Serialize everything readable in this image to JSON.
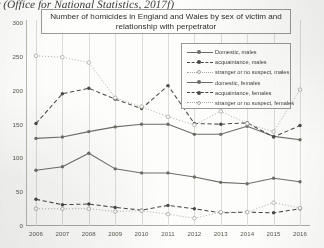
{
  "caption": "r (Office for National Statistics, 2017f)",
  "chart_title": "Number of homicides in England and Wales by sex of victim and relationship with perpetrator",
  "legend": {
    "items": [
      {
        "label": "Domestic, males",
        "style": "solid",
        "marker": "filled",
        "color": "#6e6e68"
      },
      {
        "label": "acquaintance, males",
        "style": "dashed",
        "marker": "filled",
        "color": "#4a4a45"
      },
      {
        "label": "stranger or no suspect, males",
        "style": "dotted",
        "marker": "open",
        "color": "#a6a6a0"
      },
      {
        "label": "domestic, females",
        "style": "solid",
        "marker": "filled",
        "color": "#6e6e68"
      },
      {
        "label": "acquaintance, females",
        "style": "dashed",
        "marker": "filled",
        "color": "#4a4a45"
      },
      {
        "label": "stranger or no suspect, females",
        "style": "dotted",
        "marker": "open",
        "color": "#a6a6a0"
      }
    ]
  },
  "chart_data": {
    "type": "line",
    "title": "Number of homicides in England and Wales by sex of victim and relationship with perpetrator",
    "xlabel": "",
    "ylabel": "",
    "grid": "vertical",
    "legend_position": "upper-right",
    "categories": [
      "2006",
      "2007",
      "2008",
      "2009",
      "2010",
      "2011",
      "2012",
      "2013",
      "2014",
      "2015",
      "2016"
    ],
    "x_tick_labels": [
      "2006",
      "2007",
      "2008",
      "2009",
      "2010",
      "2011",
      "2012",
      "2013",
      "2014",
      "2015",
      "2016"
    ],
    "y_tick_labels": [
      "0",
      "50",
      "100",
      "150",
      "200",
      "250",
      "300"
    ],
    "yticks": [
      0,
      50,
      100,
      150,
      200,
      250,
      300
    ],
    "ylim": [
      0,
      300
    ],
    "series": [
      {
        "name": "Domestic, males",
        "values": [
          128,
          130,
          138,
          145,
          149,
          149,
          134,
          134,
          146,
          131,
          126
        ]
      },
      {
        "name": "acquaintance, males",
        "values": [
          150,
          194,
          202,
          186,
          172,
          206,
          150,
          149,
          151,
          130,
          147
        ]
      },
      {
        "name": "stranger or no suspect, males",
        "values": [
          250,
          248,
          240,
          188,
          175,
          160,
          148,
          168,
          150,
          138,
          200
        ]
      },
      {
        "name": "domestic, females",
        "values": [
          81,
          86,
          106,
          83,
          77,
          77,
          71,
          63,
          61,
          69,
          64
        ]
      },
      {
        "name": "acquaintance, females",
        "values": [
          38,
          30,
          31,
          26,
          22,
          29,
          24,
          18,
          19,
          18,
          24
        ]
      },
      {
        "name": "stranger or no suspect, females",
        "values": [
          24,
          24,
          24,
          20,
          21,
          16,
          10,
          19,
          19,
          33,
          25
        ]
      }
    ]
  }
}
